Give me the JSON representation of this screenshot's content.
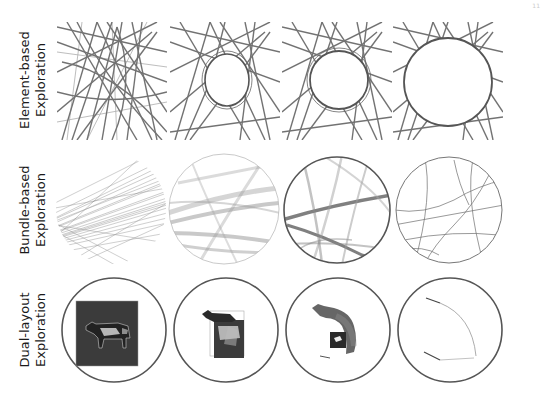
{
  "figure": {
    "page_number": "11",
    "rows": [
      {
        "id": "element",
        "label_line1": "Element-based",
        "label_line2": "Exploration",
        "panel_shape": "square",
        "panels": [
          {
            "step": 1,
            "description": "dense crossing edge strokes, no lens"
          },
          {
            "step": 2,
            "description": "small lens opening pushes edges aside"
          },
          {
            "step": 3,
            "description": "larger lens, edges routed around boundary"
          },
          {
            "step": 4,
            "description": "full circular lens cleared of edges"
          }
        ]
      },
      {
        "id": "bundle",
        "label_line1": "Bundle-based",
        "label_line2": "Exploration",
        "panel_shape": "circle",
        "panels": [
          {
            "step": 1,
            "description": "fine unbundled edges"
          },
          {
            "step": 2,
            "description": "edges beginning to bundle"
          },
          {
            "step": 3,
            "description": "thick bundled paths"
          },
          {
            "step": 4,
            "description": "thin skeleton bundle lines"
          }
        ]
      },
      {
        "id": "dual",
        "label_line1": "Dual-layout",
        "label_line2": "Exploration",
        "panel_shape": "circle",
        "panels": [
          {
            "step": 1,
            "description": "cow image in square inside lens"
          },
          {
            "step": 2,
            "description": "cow image shrinking and shifting"
          },
          {
            "step": 3,
            "description": "cow image sweeping along arc"
          },
          {
            "step": 4,
            "description": "only arc trajectory lines remain"
          }
        ]
      }
    ],
    "colors": {
      "ink": "#3a3a3a",
      "light_ink": "#8a8a8a",
      "lens_ring": "#555555",
      "image_bg": "#3b3b3b",
      "background": "#ffffff"
    }
  }
}
